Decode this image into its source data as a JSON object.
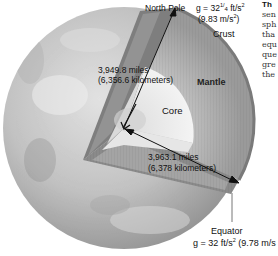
{
  "diagram": {
    "layers": [
      {
        "name": "Crust"
      },
      {
        "name": "Mantle"
      },
      {
        "name": "Core"
      }
    ],
    "labels": {
      "north_pole": "North Pole",
      "north_g_line1": "g = 32",
      "north_g_frac": "1/",
      "north_g_frac_den": "4",
      "north_g_unit": " ft/s",
      "north_g_metric": "(9.83 m/s",
      "crust": "Crust",
      "mantle": "Mantle",
      "core": "Core",
      "polar_radius_miles": "3,949.8 miles",
      "polar_radius_km": "(6,356.6 kilometers)",
      "equatorial_radius_miles": "3,963.1 miles",
      "equatorial_radius_km": "(6,378 kilometers)",
      "equator": "Equator",
      "equator_g": "g = 32 ft/s",
      "equator_g_metric": " (9.78 m/s"
    },
    "side_text_fragments": [
      "Th",
      "sen",
      "sph",
      "tha",
      "equ",
      "que",
      "gre",
      "the"
    ],
    "colors": {
      "background": "#ffffff",
      "crust": "#8a8a8a",
      "mantle": "#a9a9a9",
      "core": "#ececec",
      "surface": "#c4c4c4",
      "arrow": "#111111"
    }
  }
}
